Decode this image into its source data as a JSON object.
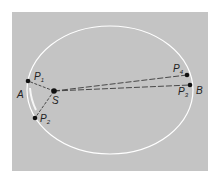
{
  "diagram": {
    "colors": {
      "background": "#c4c4c4",
      "orbit": "#ffffff",
      "lines": "#3a3a3a",
      "points": "#111111"
    },
    "orbit": {
      "cx": 110,
      "cy": 90,
      "rx": 83,
      "ry": 64
    },
    "points": {
      "S": {
        "label": "S",
        "sub": "",
        "x": 54,
        "y": 91
      },
      "P1": {
        "label": "P",
        "sub": "1",
        "x": 28,
        "y": 81
      },
      "P2": {
        "label": "P",
        "sub": "2",
        "x": 35,
        "y": 118
      },
      "P3": {
        "label": "P",
        "sub": "3",
        "x": 190,
        "y": 85
      },
      "P4": {
        "label": "P",
        "sub": "4",
        "x": 187,
        "y": 75
      }
    },
    "labels": {
      "A": "A",
      "B": "B",
      "S": "S",
      "P": "P",
      "sub1": "1",
      "sub2": "2",
      "sub3": "3",
      "sub4": "4"
    }
  }
}
